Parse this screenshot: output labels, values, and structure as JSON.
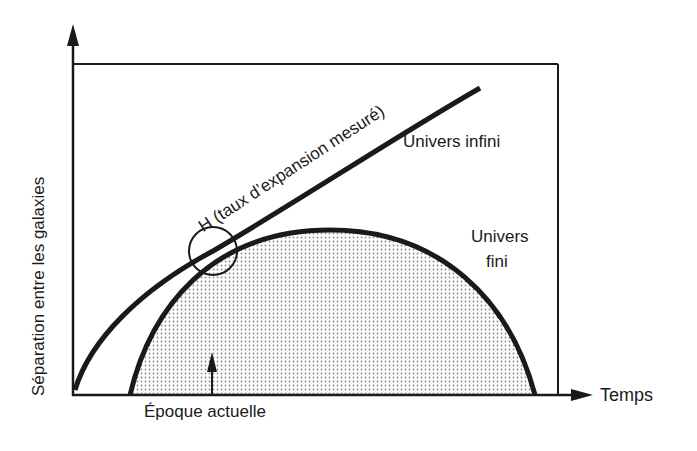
{
  "diagram": {
    "y_axis_label": "Séparation entre les galaxies",
    "x_axis_label": "Temps",
    "curves": [
      {
        "name": "Univers infini",
        "label": "Univers infini",
        "shape": "rising-curve"
      },
      {
        "name": "Univers fini",
        "label_line1": "Univers",
        "label_line2": "fini",
        "shape": "semi-ellipse-shaded"
      }
    ],
    "annotation_h": "H (taux d’expansion mesuré)",
    "marker_label": "Époque actuelle",
    "colors": {
      "ink": "#1a1a1a",
      "fill_dots": "#8a8a8a",
      "background": "#ffffff"
    }
  }
}
